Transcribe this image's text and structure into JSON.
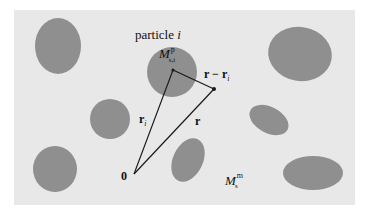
{
  "diagram": {
    "background_color": "#e8e8e8",
    "particle_color": "#8f8f8f",
    "line_color": "#1a1a1a",
    "labels": {
      "particle_title": "particle ",
      "particle_index": "i",
      "particle_domain_main": "M",
      "particle_domain_sup": "p",
      "particle_domain_sub": "s,i",
      "vector_r_minus_ri": "r − r",
      "vector_r_minus_ri_sub": "i",
      "vector_ri": "r",
      "vector_ri_sub": "i",
      "vector_r": "r",
      "origin": "0",
      "matrix_domain_main": "M",
      "matrix_domain_sup": "m",
      "matrix_domain_sub": "s"
    },
    "particles": [
      {
        "cx": 58,
        "cy": 46,
        "rx": 23,
        "ry": 28,
        "rot": 0
      },
      {
        "cx": 172,
        "cy": 72,
        "rx": 25,
        "ry": 25,
        "rot": 0
      },
      {
        "cx": 300,
        "cy": 54,
        "rx": 32,
        "ry": 27,
        "rot": 10
      },
      {
        "cx": 110,
        "cy": 119,
        "rx": 20,
        "ry": 20,
        "rot": 0
      },
      {
        "cx": 269,
        "cy": 120,
        "rx": 21,
        "ry": 13,
        "rot": 28
      },
      {
        "cx": 55,
        "cy": 169,
        "rx": 22,
        "ry": 23,
        "rot": 0
      },
      {
        "cx": 188,
        "cy": 160,
        "rx": 15,
        "ry": 23,
        "rot": 25
      },
      {
        "cx": 313,
        "cy": 173,
        "rx": 30,
        "ry": 17,
        "rot": 0
      }
    ],
    "points": {
      "origin": {
        "x": 134,
        "y": 174
      },
      "ri": {
        "x": 173,
        "y": 70
      },
      "r": {
        "x": 214,
        "y": 89
      }
    }
  }
}
